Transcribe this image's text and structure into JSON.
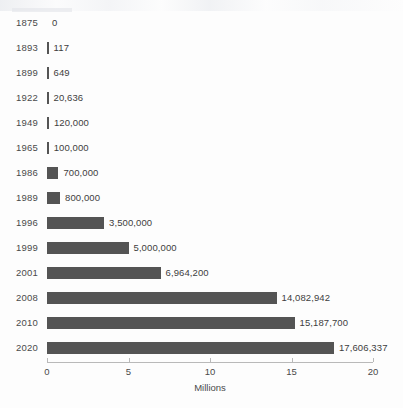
{
  "chart_data": {
    "type": "bar",
    "orientation": "horizontal",
    "title": "",
    "subtitle": "",
    "xlabel": "Millions",
    "ylabel": "",
    "xlim": [
      0,
      20
    ],
    "xticks": [
      0,
      5,
      10,
      15,
      20
    ],
    "xtick_labels": [
      "0",
      "5",
      "10",
      "15",
      "20"
    ],
    "grid": false,
    "legend": null,
    "units": "Millions",
    "bar_color": "#545454",
    "axis_color": "#b9b9b9",
    "text_color": "#4a4a4a",
    "categories": [
      "1875",
      "1893",
      "1899",
      "1922",
      "1949",
      "1965",
      "1986",
      "1989",
      "1996",
      "1999",
      "2001",
      "2008",
      "2010",
      "2020"
    ],
    "values": [
      0,
      117,
      649,
      20636,
      120000,
      100000,
      700000,
      800000,
      3500000,
      5000000,
      6964200,
      14082942,
      15187700,
      17606337
    ],
    "value_labels": [
      "0",
      "117",
      "649",
      "20,636",
      "120,000",
      "100,000",
      "700,000",
      "800,000",
      "3,500,000",
      "5,000,000",
      "6,964,200",
      "14,082,942",
      "15,187,700",
      "17,606,337"
    ],
    "rows": [
      {
        "category": "1875",
        "value": 0,
        "label": "0"
      },
      {
        "category": "1893",
        "value": 117,
        "label": "117"
      },
      {
        "category": "1899",
        "value": 649,
        "label": "649"
      },
      {
        "category": "1922",
        "value": 20636,
        "label": "20,636"
      },
      {
        "category": "1949",
        "value": 120000,
        "label": "120,000"
      },
      {
        "category": "1965",
        "value": 100000,
        "label": "100,000"
      },
      {
        "category": "1986",
        "value": 700000,
        "label": "700,000"
      },
      {
        "category": "1989",
        "value": 800000,
        "label": "800,000"
      },
      {
        "category": "1996",
        "value": 3500000,
        "label": "3,500,000"
      },
      {
        "category": "1999",
        "value": 5000000,
        "label": "5,000,000"
      },
      {
        "category": "2001",
        "value": 6964200,
        "label": "6,964,200"
      },
      {
        "category": "2008",
        "value": 14082942,
        "label": "14,082,942"
      },
      {
        "category": "2010",
        "value": 15187700,
        "label": "15,187,700"
      },
      {
        "category": "2020",
        "value": 17606337,
        "label": "17,606,337"
      }
    ]
  },
  "layout": {
    "plot_left_px": 47,
    "plot_right_px": 373,
    "first_row_center_px": 23,
    "row_pitch_px": 25,
    "axis_y_px": 362,
    "tick_label_y_px": 366,
    "axis_title_y_px": 382
  }
}
